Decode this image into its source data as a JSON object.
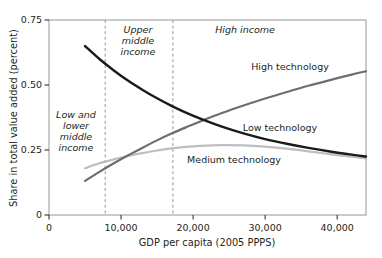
{
  "chart_data": {
    "type": "line",
    "title": "",
    "subtitle": "",
    "xlabel": "GDP per capita (2005 PPPS)",
    "ylabel": "Share in total value added (percent)",
    "xlim": [
      0,
      44000
    ],
    "ylim": [
      0,
      0.75
    ],
    "grid": false,
    "legend_position": "inline-annotations",
    "x_ticks": [
      {
        "value": 0,
        "label": "0"
      },
      {
        "value": 10000,
        "label": "10,000"
      },
      {
        "value": 20000,
        "label": "20,000"
      },
      {
        "value": 30000,
        "label": "30,000"
      },
      {
        "value": 40000,
        "label": "40,000"
      }
    ],
    "y_ticks": [
      {
        "value": 0,
        "label": "0"
      },
      {
        "value": 0.25,
        "label": "0.25"
      },
      {
        "value": 0.5,
        "label": "0.50"
      },
      {
        "value": 0.75,
        "label": "0.75"
      }
    ],
    "x": [
      5000,
      7000,
      9000,
      11000,
      13000,
      15000,
      17000,
      19000,
      21000,
      24000,
      27000,
      30000,
      33000,
      36000,
      39000,
      42000,
      44000
    ],
    "series": [
      {
        "name": "Low technology",
        "color": "#1a1a1a",
        "width": 2.4,
        "values": [
          0.65,
          0.6,
          0.556,
          0.516,
          0.481,
          0.449,
          0.42,
          0.394,
          0.371,
          0.34,
          0.314,
          0.292,
          0.274,
          0.258,
          0.244,
          0.232,
          0.225
        ]
      },
      {
        "name": "High technology",
        "color": "#6d6e71",
        "width": 2.2,
        "values": [
          0.131,
          0.166,
          0.199,
          0.23,
          0.259,
          0.287,
          0.313,
          0.337,
          0.36,
          0.392,
          0.421,
          0.448,
          0.473,
          0.497,
          0.519,
          0.54,
          0.553
        ]
      },
      {
        "name": "Medium technology",
        "color": "#bcbec0",
        "width": 2.2,
        "values": [
          0.18,
          0.199,
          0.214,
          0.227,
          0.238,
          0.248,
          0.256,
          0.262,
          0.266,
          0.269,
          0.268,
          0.263,
          0.255,
          0.245,
          0.234,
          0.224,
          0.218
        ]
      }
    ],
    "series_labels": [
      {
        "text": "High technology",
        "color": "#231f20"
      },
      {
        "text": "Low technology",
        "color": "#231f20"
      },
      {
        "text": "Medium technology",
        "color": "#231f20"
      }
    ],
    "annotations": {
      "dividers": [
        {
          "value": 7800,
          "style": "dashed",
          "color": "#939598"
        },
        {
          "value": 17200,
          "style": "dashed",
          "color": "#939598"
        }
      ],
      "regions": [
        {
          "name": "low-and-lower-middle-income",
          "lines": [
            "Low and",
            "lower",
            "middle",
            "income"
          ]
        },
        {
          "name": "upper-middle-income",
          "lines": [
            "Upper",
            "middle",
            "income"
          ]
        },
        {
          "name": "high-income",
          "lines": [
            "High income"
          ]
        }
      ]
    },
    "frame_color": "#939598"
  }
}
